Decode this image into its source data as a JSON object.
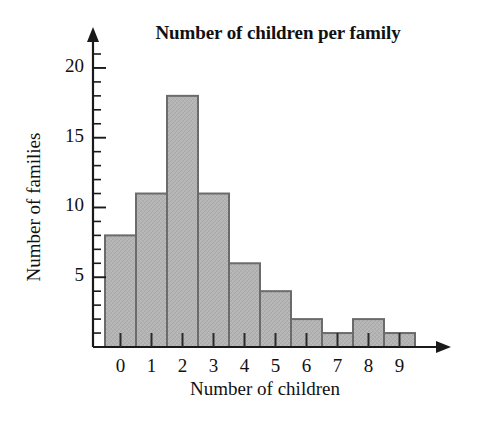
{
  "chart_data": {
    "type": "bar",
    "title": "Number of children per family",
    "xlabel": "Number of children",
    "ylabel": "Number of families",
    "categories": [
      "0",
      "1",
      "2",
      "3",
      "4",
      "5",
      "6",
      "7",
      "8",
      "9"
    ],
    "values": [
      8,
      11,
      18,
      11,
      6,
      4,
      2,
      1,
      2,
      1
    ],
    "ylim": [
      0,
      21
    ],
    "xlim": [
      0,
      10
    ],
    "y_major_ticks": [
      5,
      10,
      15,
      20
    ],
    "y_major_tick_labels": [
      "5",
      "10",
      "15",
      "20"
    ],
    "y_minor_ticks": [
      1,
      2,
      3,
      4,
      6,
      7,
      8,
      9,
      11,
      12,
      13,
      14,
      16,
      17,
      18,
      19,
      21
    ],
    "grid": false,
    "legend": null,
    "legend_position": "none",
    "bar_fill_color": "#b2b2b2",
    "bar_edge_color": "#6b6b6b",
    "axis_color": "#1a1a1a",
    "background_color": "#ffffff",
    "text_color": "#111111",
    "axis_arrows": true,
    "bar_gap": 0,
    "total_families": 64
  },
  "figure": {
    "title_label": "Number of children per family",
    "x_axis_title": "Number of children",
    "y_axis_title": "Number of families"
  }
}
